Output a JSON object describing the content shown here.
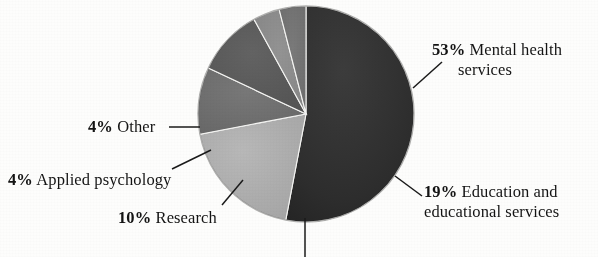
{
  "chart_data": {
    "type": "pie",
    "title": "",
    "subtitle": "",
    "xlabel": "",
    "ylabel": "",
    "legend_position": "callout-labels",
    "grid": false,
    "units": "percent",
    "total": 100,
    "categories": [
      "Mental health services",
      "Education and educational services",
      "Research",
      "Applied psychology",
      "Other"
    ],
    "values": [
      53,
      19,
      10,
      4,
      4
    ],
    "slices": [
      {
        "label": "Mental health services",
        "label_line1": "Mental health",
        "label_line2": "services",
        "percent": 53,
        "percent_text": "53%",
        "color": "#2f2f2f",
        "start_angle": 0,
        "end_angle": 190.8,
        "has_callout": true
      },
      {
        "label": "Education and educational services",
        "label_line1": "Education and",
        "label_line2": "educational services",
        "percent": 19,
        "percent_text": "19%",
        "color": "#adadad",
        "start_angle": 190.8,
        "end_angle": 259.2,
        "has_callout": true
      },
      {
        "label": "",
        "label_line1": "",
        "label_line2": "",
        "percent": 10,
        "percent_text": "",
        "color": "#6f6f6f",
        "start_angle": 259.2,
        "end_angle": 295.2,
        "has_callout": true
      },
      {
        "label": "Research",
        "label_line1": "Research",
        "label_line2": "",
        "percent": 10,
        "percent_text": "10%",
        "color": "#5a5a5a",
        "start_angle": 295.2,
        "end_angle": 331.2,
        "has_callout": true
      },
      {
        "label": "Applied psychology",
        "label_line1": "Applied psychology",
        "label_line2": "",
        "percent": 4,
        "percent_text": "4%",
        "color": "#8a8a8a",
        "start_angle": 331.2,
        "end_angle": 345.6,
        "has_callout": true
      },
      {
        "label": "Other",
        "label_line1": "Other",
        "label_line2": "",
        "percent": 4,
        "percent_text": "4%",
        "color": "#707070",
        "start_angle": 345.6,
        "end_angle": 360,
        "has_callout": true
      }
    ],
    "geometry": {
      "center_x": 306,
      "center_y": 114,
      "radius": 108
    }
  },
  "labels": {
    "mental": {
      "percent": "53%",
      "line1": "Mental health",
      "line2": "services"
    },
    "education": {
      "percent": "19%",
      "line1": "Education and",
      "line2": "educational services"
    },
    "research": {
      "percent": "10%",
      "text": "Research"
    },
    "applied": {
      "percent": "4%",
      "text": "Applied psychology"
    },
    "other": {
      "percent": "4%",
      "text": "Other"
    }
  }
}
